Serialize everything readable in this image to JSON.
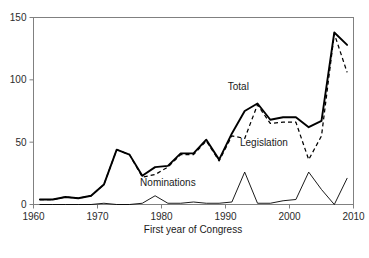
{
  "chart_data": {
    "type": "line",
    "title": "",
    "subtitle": "",
    "xlabel": "First year of Congress",
    "ylabel": "",
    "xlim": [
      1960,
      2010
    ],
    "ylim": [
      0,
      150
    ],
    "grid": false,
    "legend_position": "inline-annotations",
    "x_ticks": [
      1960,
      1970,
      1980,
      1990,
      2000,
      2010
    ],
    "y_ticks": [
      0,
      50,
      100,
      150
    ],
    "x": [
      1961,
      1963,
      1965,
      1967,
      1969,
      1971,
      1973,
      1975,
      1977,
      1979,
      1981,
      1983,
      1985,
      1987,
      1989,
      1991,
      1993,
      1995,
      1997,
      1999,
      2001,
      2003,
      2005,
      2007,
      2009
    ],
    "series": [
      {
        "name": "Total",
        "style": "solid",
        "values": [
          4,
          4,
          6,
          5,
          7,
          16,
          44,
          40,
          23,
          30,
          31,
          41,
          41,
          52,
          36,
          57,
          75,
          81,
          68,
          70,
          70,
          62,
          67,
          138,
          128
        ]
      },
      {
        "name": "Legislation",
        "style": "dashed",
        "values": [
          4,
          4,
          6,
          5,
          7,
          16,
          44,
          40,
          22,
          24,
          30,
          40,
          40,
          51,
          35,
          55,
          53,
          80,
          65,
          66,
          66,
          36,
          55,
          137,
          106
        ]
      },
      {
        "name": "Nominations",
        "style": "solid-thin",
        "values": [
          0,
          0,
          0,
          0,
          0,
          1,
          0,
          0,
          1,
          7,
          1,
          1,
          2,
          1,
          1,
          2,
          26,
          1,
          1,
          3,
          4,
          26,
          12,
          0,
          21
        ]
      }
    ],
    "annotations": [
      {
        "text": "Total",
        "x": 1992,
        "y": 92
      },
      {
        "text": "Legislation",
        "x": 1996,
        "y": 47
      },
      {
        "text": "Nominations",
        "x": 1981,
        "y": 15
      }
    ]
  },
  "axis": {
    "x_tick_labels": [
      "1960",
      "1970",
      "1980",
      "1990",
      "2000",
      "2010"
    ],
    "y_tick_labels": [
      "0",
      "50",
      "100",
      "150"
    ],
    "x_title": "First year of Congress"
  },
  "labels": {
    "total": "Total",
    "legislation": "Legislation",
    "nominations": "Nominations"
  }
}
